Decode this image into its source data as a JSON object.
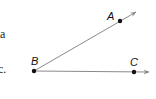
{
  "diagram": {
    "type": "angle",
    "vertex": {
      "label": "B",
      "x": 34,
      "y": 71
    },
    "rays": [
      {
        "name": "ray-BA",
        "point_label": "A",
        "point": {
          "x": 120,
          "y": 21
        },
        "arrow_tip": {
          "x": 136,
          "y": 12
        }
      },
      {
        "name": "ray-BC",
        "point_label": "C",
        "point": {
          "x": 134,
          "y": 72
        },
        "arrow_tip": {
          "x": 149,
          "y": 72
        }
      }
    ],
    "labels": {
      "A": "A",
      "B": "B",
      "C": "C"
    },
    "line_color": "#8a8a8a",
    "point_color": "#111111"
  },
  "edge_text": {
    "line1": "a",
    "line2": "c."
  }
}
